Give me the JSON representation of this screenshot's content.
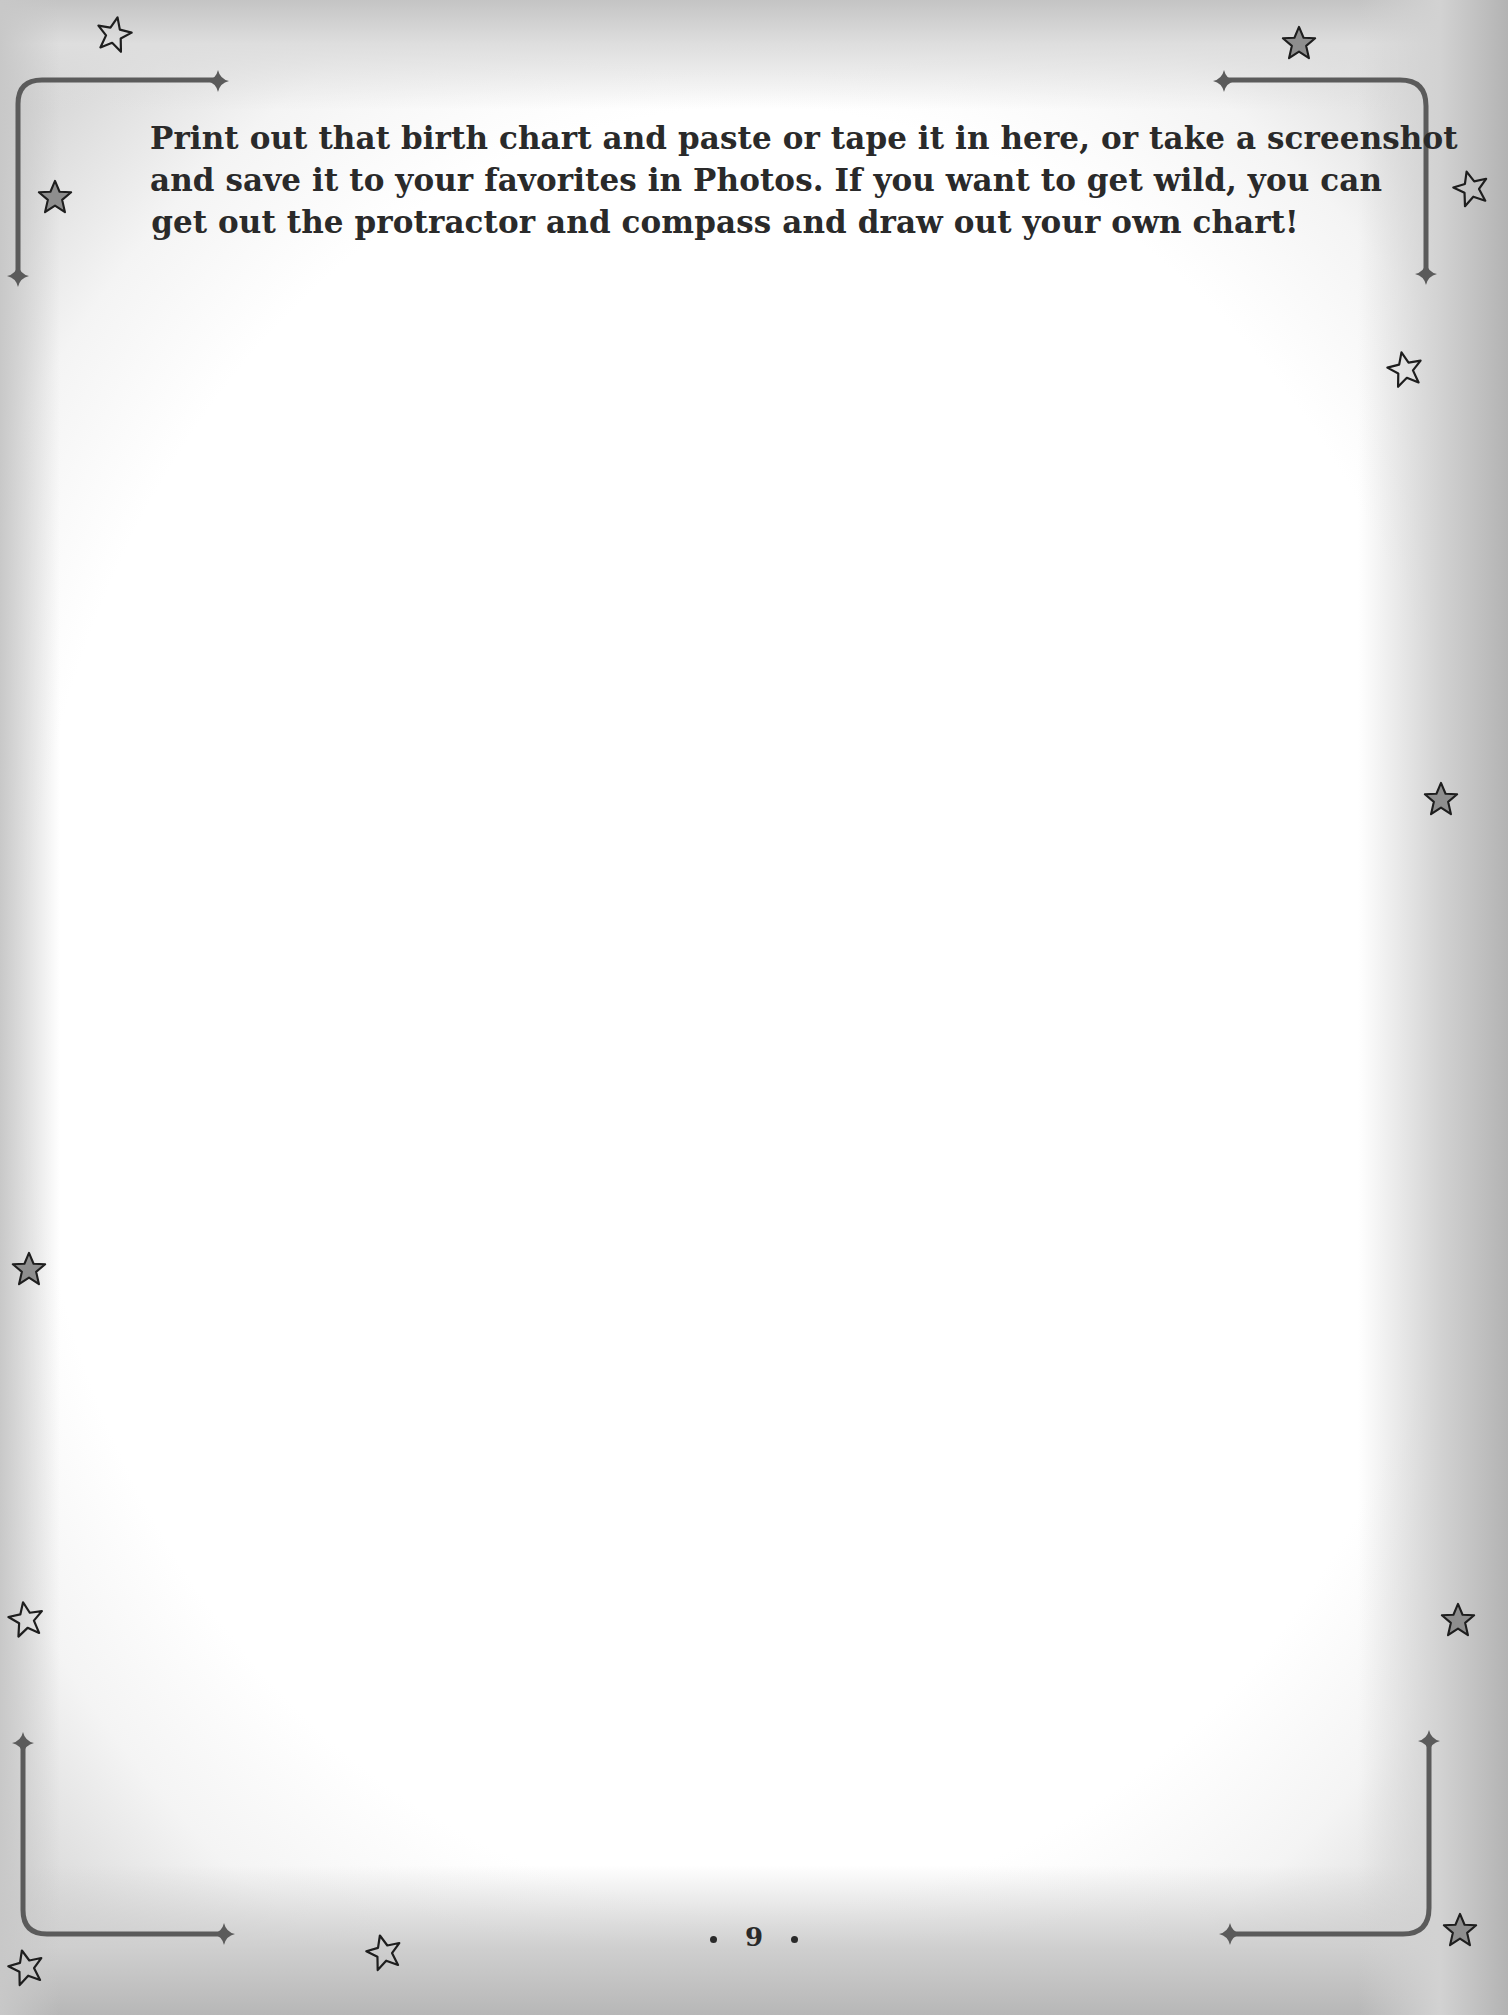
{
  "page": {
    "instructions": {
      "lines": [
        "Print out that birth chart and paste or tape it in here, or take a screenshot",
        "and save it to your favorites in Photos. If you want to get wild, you can",
        "get out the protractor and compass and draw out your own chart!"
      ]
    },
    "paste_area_label": "",
    "page_number": "9",
    "decorations": {
      "corner_brackets": [
        "top-left",
        "top-right",
        "bottom-left",
        "bottom-right"
      ],
      "stars": [
        {
          "x": 112,
          "y": 32,
          "fill": "none"
        },
        {
          "x": 1298,
          "y": 42,
          "fill": "gray"
        },
        {
          "x": 54,
          "y": 196,
          "fill": "gray"
        },
        {
          "x": 1470,
          "y": 186,
          "fill": "none"
        },
        {
          "x": 1405,
          "y": 368,
          "fill": "none"
        },
        {
          "x": 1440,
          "y": 798,
          "fill": "gray"
        },
        {
          "x": 28,
          "y": 1268,
          "fill": "gray"
        },
        {
          "x": 24,
          "y": 1618,
          "fill": "none"
        },
        {
          "x": 1458,
          "y": 1620,
          "fill": "gray"
        },
        {
          "x": 24,
          "y": 1966,
          "fill": "none"
        },
        {
          "x": 383,
          "y": 1951,
          "fill": "none"
        },
        {
          "x": 1460,
          "y": 1930,
          "fill": "gray"
        }
      ],
      "colors": {
        "bracket": "#5b5b5b",
        "star_fill_gray": "#8e8e8e",
        "star_stroke": "#1e1e1e",
        "text": "#2a2a2a"
      }
    }
  }
}
